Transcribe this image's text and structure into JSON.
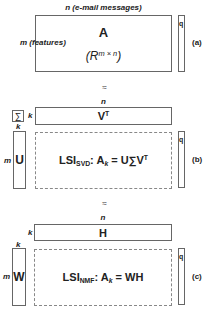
{
  "panel_a": {
    "top_label": "n (e-mail messages)",
    "left_label": "m (features)",
    "matrix_name": "A",
    "matrix_space_base": "R",
    "matrix_space_sup": "m × n",
    "q_label": "q",
    "tag": "(a)"
  },
  "approx_1": "≈",
  "panel_b": {
    "sigma_label": "∑",
    "k_right_of_sigma": "k",
    "n_label": "n",
    "vt_base": "V",
    "vt_sup": "T",
    "k_above_u": "k",
    "m_label": "m",
    "u_label": "U",
    "formula": {
      "lsi": "LSI",
      "sub": "SVD",
      "colon": ": A",
      "k_sub": "k",
      "rhs": " = U∑V",
      "rhs_sup": "T"
    },
    "q_label": "q",
    "tag": "(b)"
  },
  "approx_2": "≈",
  "panel_c": {
    "n_label": "n",
    "k_left_of_h": "k",
    "h_label": "H",
    "k_above_w": "k",
    "m_label": "m",
    "w_label": "W",
    "formula": {
      "lsi": "LSI",
      "sub": "NMF",
      "colon": ": A",
      "k_sub": "k",
      "rhs": " = WH"
    },
    "q_label": "q",
    "tag": "(c)"
  }
}
